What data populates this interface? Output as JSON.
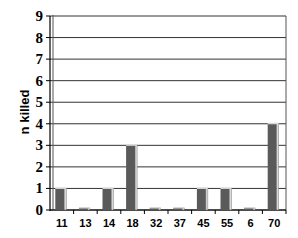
{
  "chart_data": {
    "type": "bar",
    "title": "",
    "xlabel": "",
    "ylabel": "n killed",
    "categories": [
      "11",
      "13",
      "14",
      "18",
      "32",
      "37",
      "45",
      "55",
      "6",
      "70"
    ],
    "values": [
      1,
      0,
      1,
      3,
      0,
      0,
      1,
      1,
      0,
      4
    ],
    "ylim": [
      0,
      9
    ],
    "yticks": [
      0,
      1,
      2,
      3,
      4,
      5,
      6,
      7,
      8,
      9
    ],
    "grid": true,
    "legend": null,
    "bar_color": "#5a5a5a",
    "bar_highlight": "#d8d8d8",
    "grid_color": "#333333"
  }
}
